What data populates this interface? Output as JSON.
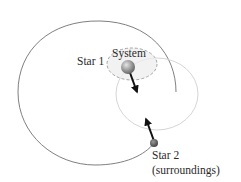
{
  "labels": {
    "system": "System",
    "star1": "Star 1",
    "star2": "Star 2",
    "surroundings": "(surroundings)"
  },
  "colors": {
    "star2_orbit": "#6e6e6e",
    "star1_orbit": "#cfcfcf",
    "system_boundary": "#9a9a9a",
    "system_fill": "#ececec",
    "star1": "#8c8c8c",
    "star2": "#555555",
    "arrow": "#111111",
    "text": "#2a2a2a"
  },
  "elements": {
    "star1": {
      "name": "Star 1",
      "role": "system"
    },
    "star2": {
      "name": "Star 2",
      "role": "surroundings"
    },
    "force_arrows": [
      {
        "on": "Star 1",
        "direction": "toward Star 2"
      },
      {
        "on": "Star 2",
        "direction": "toward Star 1"
      }
    ]
  }
}
